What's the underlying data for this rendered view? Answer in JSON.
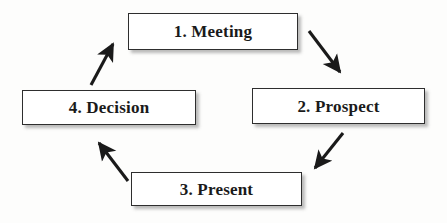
{
  "diagram": {
    "type": "cycle-flowchart",
    "direction": "clockwise",
    "background_color": "#fdfdfc",
    "box_fill_color": "#ffffff",
    "box_border_color": "#2e2e2e",
    "arrow_color": "#1a1a1a",
    "text_color": "#1a1a1a",
    "nodes": [
      {
        "id": "meeting",
        "label": "1. Meeting",
        "step": 1,
        "position": "top"
      },
      {
        "id": "prospect",
        "label": "2. Prospect",
        "step": 2,
        "position": "right"
      },
      {
        "id": "present",
        "label": "3. Present",
        "step": 3,
        "position": "bottom"
      },
      {
        "id": "decision",
        "label": "4. Decision",
        "step": 4,
        "position": "left"
      }
    ],
    "arrows": [
      {
        "id": "meeting-to-prospect",
        "from": "meeting",
        "to": "prospect",
        "direction": "down-right"
      },
      {
        "id": "prospect-to-present",
        "from": "prospect",
        "to": "present",
        "direction": "down-left"
      },
      {
        "id": "present-to-decision",
        "from": "present",
        "to": "decision",
        "direction": "up-left"
      },
      {
        "id": "decision-to-meeting",
        "from": "decision",
        "to": "meeting",
        "direction": "up-right"
      }
    ]
  }
}
